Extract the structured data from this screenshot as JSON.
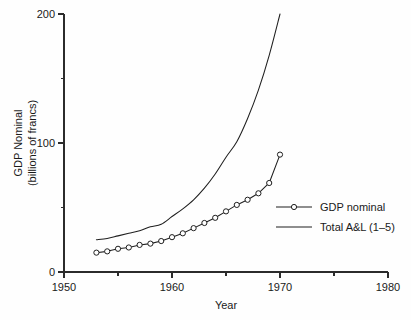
{
  "chart_data": {
    "type": "line",
    "title": "",
    "xlabel": "Year",
    "ylabel": "GDP Nominal (billions of francs)",
    "ylabel_line1": "GDP Nominal",
    "ylabel_line2": "(billions of francs)",
    "xlim": [
      1950,
      1980
    ],
    "ylim": [
      0,
      200
    ],
    "grid": false,
    "legend_position": "center-right",
    "x_major_ticks": [
      1950,
      1960,
      1970,
      1980
    ],
    "x_major_tick_labels": [
      "1950",
      "1960",
      "1970",
      "1980"
    ],
    "x_minor_ticks": [
      1955,
      1965,
      1975
    ],
    "y_major_ticks": [
      0,
      100,
      200
    ],
    "y_major_tick_labels": [
      "0",
      "100",
      "200"
    ],
    "y_minor_ticks": [
      50,
      150
    ],
    "series": [
      {
        "name": "GDP nominal",
        "marker": "circle-open",
        "line": "solid",
        "x": [
          1953,
          1954,
          1955,
          1956,
          1957,
          1958,
          1959,
          1960,
          1961,
          1962,
          1963,
          1964,
          1965,
          1966,
          1967,
          1968,
          1969,
          1970
        ],
        "values": [
          15,
          16,
          18,
          19,
          21,
          22,
          24,
          27,
          30,
          34,
          38,
          42,
          47,
          52,
          56,
          61,
          69,
          91
        ]
      },
      {
        "name": "Total A&L (1–5)",
        "marker": "none",
        "line": "solid",
        "x": [
          1953,
          1954,
          1955,
          1956,
          1957,
          1958,
          1959,
          1960,
          1961,
          1962,
          1963,
          1964,
          1965,
          1966,
          1967,
          1968,
          1969,
          1970
        ],
        "values": [
          25,
          26,
          28,
          30,
          32,
          35,
          37,
          43,
          49,
          56,
          65,
          76,
          89,
          101,
          119,
          141,
          168,
          200
        ]
      }
    ]
  },
  "legend": {
    "entries": [
      {
        "label": "GDP nominal",
        "marker": "circle-open"
      },
      {
        "label": "Total A&L (1–5)",
        "marker": "none"
      }
    ]
  },
  "colors": {
    "ink": "#1f1f1f",
    "axis": "#2b2b2b",
    "background": "#ffffff",
    "marker_fill": "#ffffff"
  }
}
